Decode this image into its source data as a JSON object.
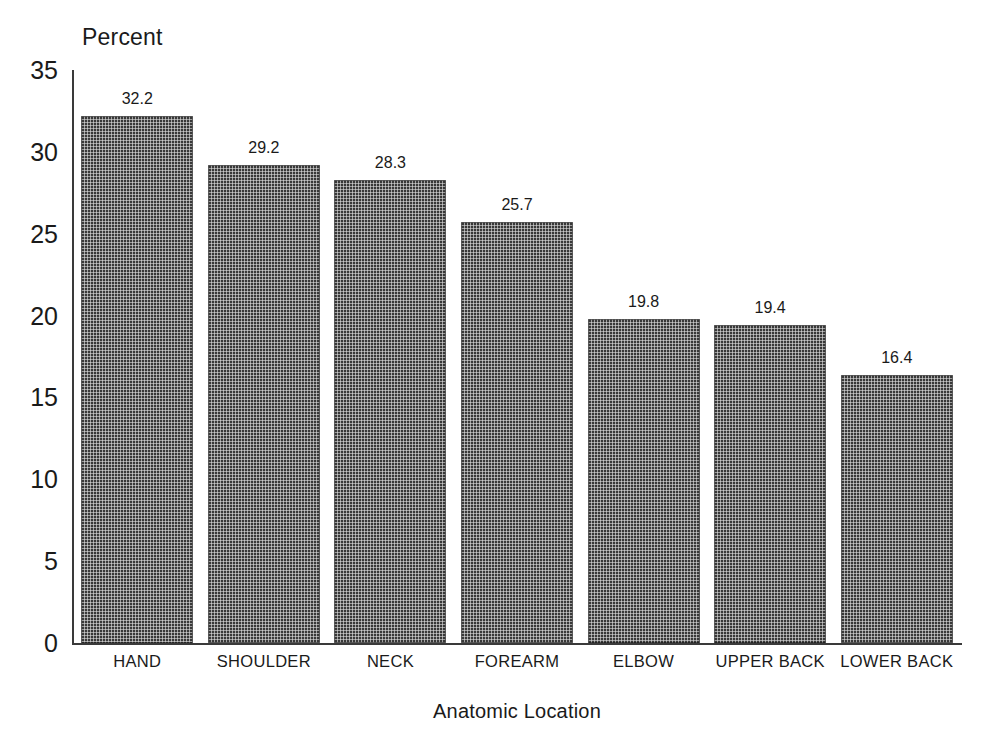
{
  "chart_data": {
    "type": "bar",
    "title": "",
    "subtitle": "",
    "xlabel": "Anatomic Location",
    "ylabel": "Percent",
    "categories": [
      "HAND",
      "SHOULDER",
      "NECK",
      "FOREARM",
      "ELBOW",
      "UPPER BACK",
      "LOWER BACK"
    ],
    "values": [
      32.2,
      29.2,
      28.3,
      25.7,
      19.8,
      19.4,
      16.4
    ],
    "value_labels": [
      "32.2",
      "29.2",
      "28.3",
      "25.7",
      "19.8",
      "19.4",
      "16.4"
    ],
    "ylim": [
      0,
      35
    ],
    "ytick_step": 5,
    "ytick_labels": [
      "35",
      "30",
      "25",
      "20",
      "15",
      "10",
      "5",
      "0"
    ],
    "ytick_values": [
      35,
      30,
      25,
      20,
      15,
      10,
      5,
      0
    ],
    "grid": false,
    "legend": false,
    "legend_position": "none",
    "bar_color": "#383838",
    "bar_pattern": "cross-hatch",
    "axis_color": "#3a3a3a",
    "background_color": "#ffffff",
    "text_color": "#1a1a1a"
  }
}
